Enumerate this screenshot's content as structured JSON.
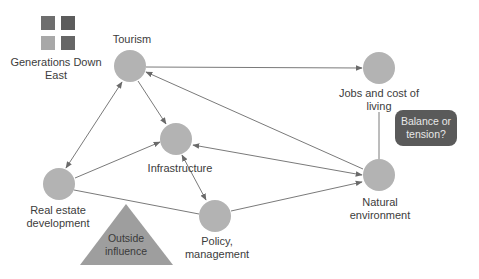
{
  "legend": {
    "title": "Generations Down East",
    "squares": [
      {
        "color": "#6e6e6e"
      },
      {
        "color": "#5c5c5c"
      },
      {
        "color": "#a8a8a8"
      },
      {
        "color": "#666666"
      }
    ]
  },
  "nodes": {
    "tourism": {
      "label": "Tourism"
    },
    "infrastructure": {
      "label": "Infrastructure"
    },
    "policy": {
      "label_line1": "Policy,",
      "label_line2": "management"
    },
    "real_estate": {
      "label_line1": "Real estate",
      "label_line2": "development"
    },
    "jobs": {
      "label_line1": "Jobs and cost of",
      "label_line2": "living"
    },
    "natural": {
      "label_line1": "Natural",
      "label_line2": "environment"
    }
  },
  "outside_influence": {
    "line1": "Outside",
    "line2": "influence"
  },
  "callout": {
    "line1": "Balance or",
    "line2": "tension?"
  },
  "colors": {
    "node": "#b3b3b3",
    "edge": "#7a7a7a",
    "triangle": "#9e9e9e",
    "callout_bg": "#5a5a5a"
  }
}
